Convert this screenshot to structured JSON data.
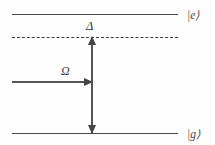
{
  "figure": {
    "type": "energy-level-diagram",
    "width": 215,
    "height": 145,
    "background_color": "#fefefe",
    "line_color": "#4a4a4a"
  },
  "levels": [
    {
      "id": "excited",
      "style": "solid",
      "ket_label": "|e⟩",
      "y": 14
    },
    {
      "id": "detuned",
      "style": "dashed",
      "ket_label": "",
      "y": 37
    },
    {
      "id": "ground",
      "style": "solid",
      "ket_label": "|g⟩",
      "y": 133
    }
  ],
  "arrows": {
    "detuning": {
      "label": "Δ",
      "orientation": "vertical",
      "heads": "both",
      "from_level": "detuned",
      "to_level": "ground"
    },
    "coupling": {
      "label": "Ω",
      "orientation": "horizontal",
      "heads": "right",
      "at_y": 82
    }
  }
}
